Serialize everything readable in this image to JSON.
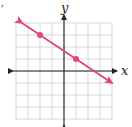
{
  "problem_fragment": ",",
  "chart_data": {
    "type": "line",
    "title": "",
    "xlabel": "x",
    "ylabel": "y",
    "xlim": [
      -4,
      4
    ],
    "ylim": [
      -4,
      4
    ],
    "grid": true,
    "grid_step": 1,
    "axes_arrows": true,
    "series": [
      {
        "name": "line",
        "equation": "y = -2/3 x + 5/3",
        "slope": -0.6667,
        "intercept": 1.6667,
        "x_range": [
          -3.5,
          4.0
        ],
        "arrows_both_ends": true,
        "color": "#e0457b",
        "points": [
          {
            "x": -2,
            "y": 3
          },
          {
            "x": 1,
            "y": 1
          }
        ]
      }
    ],
    "colors": {
      "grid": "#cfcfcf",
      "axis": "#222222",
      "line": "#e0457b"
    }
  }
}
